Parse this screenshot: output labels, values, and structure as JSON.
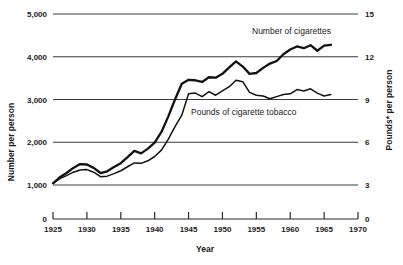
{
  "chart_data": {
    "type": "line",
    "title": "",
    "xlabel": "Year",
    "ylabel": "Number per person",
    "ylabel_right": "Pounds* per person",
    "xlim": [
      1925,
      1970
    ],
    "ylim": [
      0,
      5000
    ],
    "ylim_right": [
      0,
      15
    ],
    "grid": true,
    "gridlines_y": [
      1000,
      2000,
      3000,
      4000,
      5000
    ],
    "xticks": [
      1925,
      1930,
      1935,
      1940,
      1945,
      1950,
      1955,
      1960,
      1965,
      1970
    ],
    "xtick_labels": [
      "1925",
      "1930",
      "1935",
      "1940",
      "1945",
      "1950",
      "1955",
      "1960",
      "1965",
      "1970"
    ],
    "yticks": [
      1000,
      2000,
      3000,
      4000,
      5000
    ],
    "ytick_labels": [
      "1,000",
      "2,000",
      "3,000",
      "4,000",
      "5,000"
    ],
    "ytick_zero_label": "0",
    "yticks_right": [
      3,
      6,
      9,
      12,
      15
    ],
    "ytick_labels_right": [
      "3",
      "6",
      "9",
      "12",
      "15"
    ],
    "ytick_zero_label_right": "0",
    "legend_position": "inline-annotation",
    "series": [
      {
        "name": "Number of cigarettes",
        "label": "Number of cigarettes",
        "axis": "left",
        "units": "number per person",
        "x": [
          1925,
          1926,
          1927,
          1928,
          1929,
          1930,
          1931,
          1932,
          1933,
          1934,
          1935,
          1936,
          1937,
          1938,
          1939,
          1940,
          1941,
          1942,
          1943,
          1944,
          1945,
          1946,
          1947,
          1948,
          1949,
          1950,
          1951,
          1952,
          1953,
          1954,
          1955,
          1956,
          1957,
          1958,
          1959,
          1960,
          1961,
          1962,
          1963,
          1964,
          1965,
          1966
        ],
        "values": [
          1040,
          1180,
          1280,
          1400,
          1490,
          1480,
          1400,
          1280,
          1320,
          1420,
          1510,
          1650,
          1800,
          1740,
          1850,
          1990,
          2240,
          2600,
          3000,
          3370,
          3460,
          3450,
          3410,
          3520,
          3510,
          3600,
          3750,
          3890,
          3770,
          3600,
          3620,
          3740,
          3840,
          3900,
          4060,
          4170,
          4240,
          4200,
          4270,
          4140,
          4260,
          4280
        ]
      },
      {
        "name": "Pounds of cigarette tobacco",
        "label": "Pounds of cigarette tobacco",
        "axis": "right",
        "units": "pounds per person",
        "x": [
          1925,
          1926,
          1927,
          1928,
          1929,
          1930,
          1931,
          1932,
          1933,
          1934,
          1935,
          1936,
          1937,
          1938,
          1939,
          1940,
          1941,
          1942,
          1943,
          1944,
          1945,
          1946,
          1947,
          1948,
          1949,
          1950,
          1951,
          1952,
          1953,
          1954,
          1955,
          1956,
          1957,
          1958,
          1959,
          1960,
          1961,
          1962,
          1963,
          1964,
          1965,
          1966
        ],
        "values_right": [
          3.12,
          3.45,
          3.66,
          3.9,
          4.05,
          4.08,
          3.9,
          3.58,
          3.62,
          3.8,
          4.0,
          4.28,
          4.55,
          4.52,
          4.7,
          5.0,
          5.45,
          6.2,
          7.1,
          7.9,
          9.4,
          9.45,
          9.2,
          9.55,
          9.3,
          9.6,
          9.9,
          10.35,
          10.25,
          9.5,
          9.3,
          9.25,
          9.05,
          9.2,
          9.35,
          9.4,
          9.7,
          9.6,
          9.75,
          9.45,
          9.25,
          9.35
        ]
      }
    ],
    "annotations": [
      {
        "text": "Number of cigarettes",
        "x": 1957,
        "y": 4620
      },
      {
        "text": "Pounds of cigarette tobacco",
        "x": 1947,
        "y": 2760
      }
    ]
  },
  "footnote": ""
}
